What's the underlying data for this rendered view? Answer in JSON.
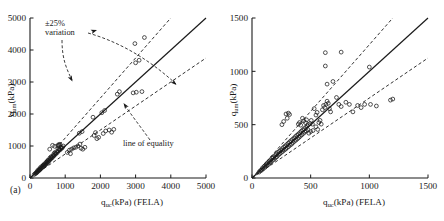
{
  "figure": {
    "panels": [
      {
        "id": "a",
        "sublabel": "(a)",
        "xlabel_main": "q",
        "xlabel_sub": "uc",
        "xlabel_tail": "(kPa) (FELA)",
        "ylabel_main": "q",
        "ylabel_sub": "um",
        "ylabel_tail": "(kPa)",
        "annotations": {
          "variation_line1": "±25%",
          "variation_line2": "variation",
          "equality": "line of equality"
        }
      },
      {
        "id": "b",
        "sublabel": "(b)",
        "xlabel_main": "q",
        "xlabel_sub": "uc",
        "xlabel_tail": "(kPa) (FELA)",
        "ylabel_main": "q",
        "ylabel_sub": "um",
        "ylabel_tail": "(kPa)"
      }
    ]
  },
  "chart_data": [
    {
      "type": "scatter",
      "panel": "a",
      "title": "",
      "xlabel": "q_uc(kPa) (FELA)",
      "ylabel": "q_um(kPa)",
      "xlim": [
        0,
        5000
      ],
      "ylim": [
        0,
        5000
      ],
      "xticks": [
        0,
        1000,
        2000,
        3000,
        4000,
        5000
      ],
      "yticks": [
        0,
        1000,
        2000,
        3000,
        4000,
        5000
      ],
      "xticklabels": [
        "0",
        "1000",
        "2000",
        "3000",
        "4000",
        "5000"
      ],
      "yticklabels": [
        "0",
        "1000",
        "2000",
        "3000",
        "4000",
        "5000"
      ],
      "grid": false,
      "legend": "none",
      "marker": "open-circle",
      "reference_lines": [
        {
          "name": "line of equality",
          "style": "solid",
          "slope": 1.0,
          "intercept": 0
        },
        {
          "name": "+25% variation",
          "style": "dashed",
          "slope": 1.25,
          "intercept": 0
        },
        {
          "name": "-25% variation",
          "style": "dashed",
          "slope": 0.75,
          "intercept": 0
        }
      ],
      "annotations": [
        {
          "text": "±25% variation",
          "x": 700,
          "y": 4550
        },
        {
          "text": "line of equality",
          "x": 3050,
          "y": 1300
        }
      ],
      "points": [
        [
          120,
          110
        ],
        [
          150,
          140
        ],
        [
          170,
          150
        ],
        [
          190,
          185
        ],
        [
          200,
          175
        ],
        [
          215,
          230
        ],
        [
          230,
          210
        ],
        [
          250,
          265
        ],
        [
          260,
          240
        ],
        [
          275,
          250
        ],
        [
          290,
          320
        ],
        [
          300,
          285
        ],
        [
          320,
          300
        ],
        [
          330,
          360
        ],
        [
          345,
          330
        ],
        [
          360,
          350
        ],
        [
          380,
          410
        ],
        [
          395,
          375
        ],
        [
          410,
          400
        ],
        [
          425,
          455
        ],
        [
          440,
          420
        ],
        [
          455,
          440
        ],
        [
          470,
          500
        ],
        [
          485,
          470
        ],
        [
          500,
          490
        ],
        [
          515,
          560
        ],
        [
          530,
          520
        ],
        [
          545,
          545
        ],
        [
          560,
          610
        ],
        [
          575,
          580
        ],
        [
          590,
          600
        ],
        [
          610,
          660
        ],
        [
          625,
          630
        ],
        [
          640,
          650
        ],
        [
          660,
          720
        ],
        [
          675,
          690
        ],
        [
          690,
          710
        ],
        [
          710,
          780
        ],
        [
          725,
          745
        ],
        [
          745,
          770
        ],
        [
          760,
          830
        ],
        [
          780,
          800
        ],
        [
          800,
          845
        ],
        [
          820,
          900
        ],
        [
          840,
          870
        ],
        [
          860,
          890
        ],
        [
          880,
          960
        ],
        [
          900,
          930
        ],
        [
          920,
          950
        ],
        [
          945,
          1000
        ],
        [
          790,
          1010
        ],
        [
          810,
          1040
        ],
        [
          830,
          1020
        ],
        [
          850,
          1055
        ],
        [
          1060,
          800
        ],
        [
          1120,
          870
        ],
        [
          1180,
          900
        ],
        [
          1240,
          940
        ],
        [
          1300,
          960
        ],
        [
          1360,
          1000
        ],
        [
          1420,
          1060
        ],
        [
          1150,
          760
        ],
        [
          1450,
          930
        ],
        [
          1500,
          900
        ],
        [
          1560,
          960
        ],
        [
          1790,
          1900
        ],
        [
          1820,
          1330
        ],
        [
          1860,
          1420
        ],
        [
          1900,
          1230
        ],
        [
          1950,
          1270
        ],
        [
          2080,
          1390
        ],
        [
          2150,
          1470
        ],
        [
          2250,
          1500
        ],
        [
          2320,
          1430
        ],
        [
          2380,
          1520
        ],
        [
          2480,
          2620
        ],
        [
          2540,
          2700
        ],
        [
          2930,
          2660
        ],
        [
          3020,
          2680
        ],
        [
          3180,
          2700
        ],
        [
          2980,
          4200
        ],
        [
          3250,
          4390
        ],
        [
          3000,
          3600
        ],
        [
          3100,
          3680
        ],
        [
          2040,
          2040
        ],
        [
          2120,
          2110
        ],
        [
          1400,
          1400
        ],
        [
          1480,
          1450
        ],
        [
          640,
          1020
        ],
        [
          700,
          990
        ],
        [
          560,
          900
        ]
      ]
    },
    {
      "type": "scatter",
      "panel": "b",
      "title": "",
      "xlabel": "q_uc(kPa) (FELA)",
      "ylabel": "q_um(kPa)",
      "xlim": [
        0,
        1500
      ],
      "ylim": [
        0,
        1500
      ],
      "xticks": [
        0,
        500,
        1000,
        1500
      ],
      "yticks": [
        0,
        500,
        1000,
        1500
      ],
      "xticklabels": [
        "0",
        "500",
        "1000",
        "1500"
      ],
      "yticklabels": [
        "0",
        "500",
        "1000",
        "1500"
      ],
      "grid": false,
      "legend": "none",
      "marker": "open-circle",
      "reference_lines": [
        {
          "name": "line of equality",
          "style": "solid",
          "slope": 1.0,
          "intercept": 0
        },
        {
          "name": "+25% variation",
          "style": "dashed",
          "slope": 1.25,
          "intercept": 0
        },
        {
          "name": "-25% variation",
          "style": "dashed",
          "slope": 0.75,
          "intercept": 0
        }
      ],
      "points": [
        [
          60,
          55
        ],
        [
          70,
          68
        ],
        [
          80,
          72
        ],
        [
          90,
          95
        ],
        [
          95,
          85
        ],
        [
          105,
          110
        ],
        [
          110,
          100
        ],
        [
          120,
          128
        ],
        [
          125,
          115
        ],
        [
          130,
          140
        ],
        [
          138,
          125
        ],
        [
          145,
          155
        ],
        [
          150,
          142
        ],
        [
          158,
          170
        ],
        [
          162,
          150
        ],
        [
          170,
          185
        ],
        [
          175,
          165
        ],
        [
          182,
          195
        ],
        [
          188,
          175
        ],
        [
          195,
          210
        ],
        [
          200,
          190
        ],
        [
          208,
          225
        ],
        [
          212,
          200
        ],
        [
          220,
          238
        ],
        [
          225,
          215
        ],
        [
          232,
          250
        ],
        [
          238,
          228
        ],
        [
          245,
          262
        ],
        [
          250,
          240
        ],
        [
          258,
          275
        ],
        [
          262,
          250
        ],
        [
          270,
          288
        ],
        [
          275,
          262
        ],
        [
          282,
          300
        ],
        [
          288,
          272
        ],
        [
          295,
          312
        ],
        [
          300,
          285
        ],
        [
          308,
          325
        ],
        [
          312,
          295
        ],
        [
          320,
          338
        ],
        [
          325,
          308
        ],
        [
          332,
          350
        ],
        [
          338,
          318
        ],
        [
          345,
          362
        ],
        [
          350,
          332
        ],
        [
          358,
          375
        ],
        [
          362,
          345
        ],
        [
          370,
          388
        ],
        [
          375,
          355
        ],
        [
          382,
          400
        ],
        [
          388,
          368
        ],
        [
          395,
          412
        ],
        [
          400,
          380
        ],
        [
          408,
          425
        ],
        [
          412,
          392
        ],
        [
          420,
          438
        ],
        [
          425,
          405
        ],
        [
          432,
          450
        ],
        [
          438,
          418
        ],
        [
          445,
          462
        ],
        [
          450,
          430
        ],
        [
          458,
          475
        ],
        [
          462,
          442
        ],
        [
          470,
          488
        ],
        [
          475,
          455
        ],
        [
          290,
          600
        ],
        [
          310,
          608
        ],
        [
          320,
          595
        ],
        [
          300,
          560
        ],
        [
          270,
          530
        ],
        [
          255,
          500
        ],
        [
          395,
          505
        ],
        [
          405,
          520
        ],
        [
          415,
          495
        ],
        [
          430,
          560
        ],
        [
          440,
          535
        ],
        [
          455,
          520
        ],
        [
          465,
          545
        ],
        [
          480,
          500
        ],
        [
          495,
          510
        ],
        [
          505,
          540
        ],
        [
          515,
          505
        ],
        [
          530,
          650
        ],
        [
          545,
          590
        ],
        [
          555,
          615
        ],
        [
          570,
          520
        ],
        [
          580,
          540
        ],
        [
          590,
          505
        ],
        [
          600,
          640
        ],
        [
          610,
          680
        ],
        [
          620,
          660
        ],
        [
          630,
          690
        ],
        [
          640,
          720
        ],
        [
          650,
          700
        ],
        [
          660,
          650
        ],
        [
          670,
          620
        ],
        [
          625,
          1050
        ],
        [
          640,
          880
        ],
        [
          690,
          905
        ],
        [
          760,
          1180
        ],
        [
          625,
          1175
        ],
        [
          720,
          755
        ],
        [
          740,
          690
        ],
        [
          760,
          670
        ],
        [
          800,
          710
        ],
        [
          830,
          690
        ],
        [
          860,
          620
        ],
        [
          900,
          680
        ],
        [
          930,
          660
        ],
        [
          960,
          690
        ],
        [
          1000,
          1040
        ],
        [
          1010,
          690
        ],
        [
          1060,
          675
        ],
        [
          1180,
          730
        ],
        [
          1200,
          740
        ],
        [
          545,
          480
        ],
        [
          560,
          455
        ],
        [
          520,
          445
        ],
        [
          485,
          420
        ],
        [
          500,
          435
        ]
      ]
    }
  ]
}
